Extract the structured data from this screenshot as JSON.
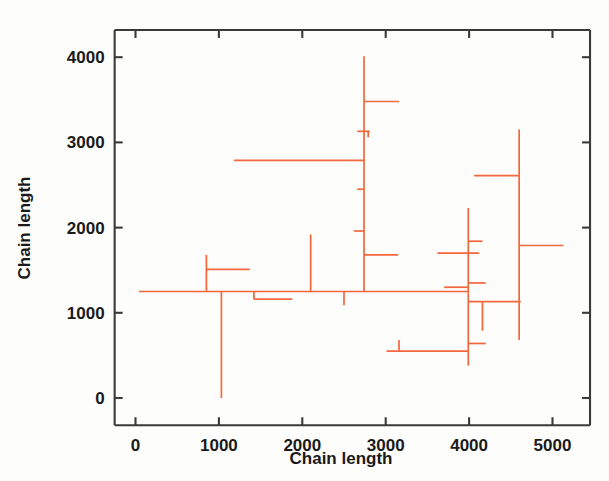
{
  "figure": {
    "background_color": "#fdfdfb",
    "axis_color": "#3a3a36",
    "data_color": "#f4663c"
  },
  "chart_data": {
    "type": "line",
    "title": "",
    "subtitle": "",
    "xlabel": "Chain length",
    "ylabel": "Chain length",
    "xlim": [
      -250,
      5450
    ],
    "ylim": [
      -300,
      4350
    ],
    "xticks": [
      0,
      1000,
      2000,
      3000,
      4000,
      5000
    ],
    "yticks": [
      0,
      1000,
      2000,
      3000,
      4000
    ],
    "xticklabels": [
      "0",
      "1000",
      "2000",
      "3000",
      "4000",
      "5000"
    ],
    "yticklabels": [
      "0",
      "1000",
      "2000",
      "3000",
      "4000"
    ],
    "grid": false,
    "legend": null,
    "annotations": [],
    "series": [
      {
        "name": "chain-length-tree",
        "color": "#f4663c",
        "description": "Orthogonal step segments forming a branching chain-length tree",
        "segments": [
          {
            "id": "trunk-baseline",
            "orientation": "horizontal",
            "y": 1250,
            "x0": 40,
            "x1": 3990
          },
          {
            "id": "branch-850-up",
            "orientation": "vertical",
            "x": 850,
            "y0": 1250,
            "y1": 1680
          },
          {
            "id": "branch-850-top",
            "orientation": "horizontal",
            "y": 1510,
            "x0": 850,
            "x1": 1370
          },
          {
            "id": "branch-1030-down",
            "orientation": "vertical",
            "x": 1030,
            "y0": 1250,
            "y1": 0
          },
          {
            "id": "branch-1420-down",
            "orientation": "vertical",
            "x": 1420,
            "y0": 1250,
            "y1": 1160
          },
          {
            "id": "branch-1420-h",
            "orientation": "horizontal",
            "y": 1160,
            "x0": 1420,
            "x1": 1880
          },
          {
            "id": "branch-1180-2790",
            "orientation": "horizontal",
            "y": 2790,
            "x0": 1180,
            "x1": 2740
          },
          {
            "id": "branch-2100-up",
            "orientation": "vertical",
            "x": 2100,
            "y0": 1250,
            "y1": 1920
          },
          {
            "id": "branch-2500-down",
            "orientation": "vertical",
            "x": 2500,
            "y0": 1250,
            "y1": 1090
          },
          {
            "id": "trunk-2740-tall",
            "orientation": "vertical",
            "x": 2740,
            "y0": 1250,
            "y1": 4010
          },
          {
            "id": "branch-2740-3480",
            "orientation": "horizontal",
            "y": 3480,
            "x0": 2740,
            "x1": 3160
          },
          {
            "id": "branch-2700-3130",
            "orientation": "horizontal",
            "y": 3130,
            "x0": 2660,
            "x1": 2810
          },
          {
            "id": "branch-2700-3130-stub",
            "orientation": "vertical",
            "x": 2790,
            "y0": 3130,
            "y1": 3060
          },
          {
            "id": "branch-2740-2450",
            "orientation": "horizontal",
            "y": 2450,
            "x0": 2660,
            "x1": 2740
          },
          {
            "id": "branch-2740-1960",
            "orientation": "horizontal",
            "y": 1960,
            "x0": 2620,
            "x1": 2740
          },
          {
            "id": "branch-2740-1680",
            "orientation": "horizontal",
            "y": 1680,
            "x0": 2740,
            "x1": 3150
          },
          {
            "id": "branch-3010-550",
            "orientation": "horizontal",
            "y": 550,
            "x0": 3010,
            "x1": 3990
          },
          {
            "id": "branch-3160-up",
            "orientation": "vertical",
            "x": 3160,
            "y0": 550,
            "y1": 680
          },
          {
            "id": "branch-3620-1700",
            "orientation": "horizontal",
            "y": 1700,
            "x0": 3620,
            "x1": 4120
          },
          {
            "id": "branch-3700-1300",
            "orientation": "horizontal",
            "y": 1300,
            "x0": 3700,
            "x1": 3990
          },
          {
            "id": "trunk-3990-vert",
            "orientation": "vertical",
            "x": 3990,
            "y0": 380,
            "y1": 2230
          },
          {
            "id": "branch-3990-1840",
            "orientation": "horizontal",
            "y": 1840,
            "x0": 3990,
            "x1": 4160
          },
          {
            "id": "branch-3990-1350",
            "orientation": "horizontal",
            "y": 1350,
            "x0": 3990,
            "x1": 4200
          },
          {
            "id": "branch-3990-1130",
            "orientation": "horizontal",
            "y": 1130,
            "x0": 3990,
            "x1": 4620
          },
          {
            "id": "branch-4160-down",
            "orientation": "vertical",
            "x": 4160,
            "y0": 1130,
            "y1": 790
          },
          {
            "id": "branch-3990-640",
            "orientation": "horizontal",
            "y": 640,
            "x0": 3990,
            "x1": 4200
          },
          {
            "id": "trunk-4600-vert",
            "orientation": "vertical",
            "x": 4600,
            "y0": 680,
            "y1": 3150
          },
          {
            "id": "branch-4600-2610",
            "orientation": "horizontal",
            "y": 2610,
            "x0": 4060,
            "x1": 4600
          },
          {
            "id": "branch-4600-1790",
            "orientation": "horizontal",
            "y": 1790,
            "x0": 4600,
            "x1": 5130
          }
        ]
      }
    ]
  }
}
